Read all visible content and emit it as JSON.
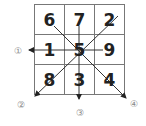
{
  "diagram": {
    "type": "magic-square",
    "grid": [
      [
        "6",
        "7",
        "2"
      ],
      [
        "1",
        "5",
        "9"
      ],
      [
        "8",
        "3",
        "4"
      ]
    ],
    "arrows": [
      {
        "label": "①",
        "direction": "left",
        "from": "center",
        "through": "1"
      },
      {
        "label": "②",
        "direction": "down-left",
        "from": "top-right",
        "through": "5, 8"
      },
      {
        "label": "③",
        "direction": "down",
        "from": "top-middle",
        "through": "7, 5, 3"
      },
      {
        "label": "④",
        "direction": "down-right",
        "from": "top-left",
        "through": "6, 5, 4"
      }
    ],
    "colors": {
      "line": "#333333",
      "grid": "#777777",
      "label": "#888888"
    }
  }
}
